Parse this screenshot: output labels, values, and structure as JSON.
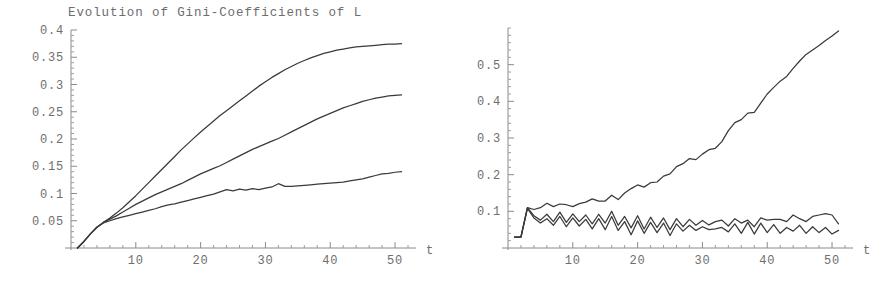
{
  "page": {
    "background_color": "#ffffff",
    "line_color": "#3a3a3a",
    "axis_color": "#8a8a8a",
    "text_color": "#6e6e6e"
  },
  "panels": [
    {
      "id": "left",
      "title": "Evolution of Gini-Coefficients of L",
      "xlabel": "t",
      "ylabel": "",
      "ytick_labels": [
        "0.05",
        "0.1",
        "0.15",
        "0.2",
        "0.25",
        "0.3",
        "0.35",
        "0.4"
      ],
      "xtick_labels": [
        "10",
        "20",
        "30",
        "40",
        "50"
      ]
    },
    {
      "id": "right",
      "title": "Evolution of Gini-Coefficients of Y / L",
      "xlabel": "t",
      "ylabel": "",
      "ytick_labels": [
        "0.1",
        "0.2",
        "0.3",
        "0.4",
        "0.5"
      ],
      "xtick_labels": [
        "10",
        "20",
        "30",
        "40",
        "50"
      ]
    }
  ],
  "chart_data": [
    {
      "type": "line",
      "title": "Evolution of Gini-Coefficients of L",
      "xlabel": "t",
      "ylabel": "",
      "xlim": [
        0,
        52
      ],
      "ylim": [
        0,
        0.4
      ],
      "xticks": [
        10,
        20,
        30,
        40,
        50
      ],
      "yticks": [
        0.05,
        0.1,
        0.15,
        0.2,
        0.25,
        0.3,
        0.35,
        0.4
      ],
      "grid": false,
      "legend": "none",
      "x": [
        1,
        2,
        3,
        4,
        5,
        6,
        7,
        8,
        9,
        10,
        11,
        12,
        13,
        14,
        15,
        16,
        17,
        18,
        19,
        20,
        21,
        22,
        23,
        24,
        25,
        26,
        27,
        28,
        29,
        30,
        31,
        32,
        33,
        34,
        35,
        36,
        37,
        38,
        39,
        40,
        41,
        42,
        43,
        44,
        45,
        46,
        47,
        48,
        49,
        50,
        51
      ],
      "series": [
        {
          "name": "upper",
          "values": [
            0.0,
            0.012,
            0.026,
            0.038,
            0.047,
            0.055,
            0.064,
            0.074,
            0.085,
            0.096,
            0.108,
            0.12,
            0.132,
            0.144,
            0.156,
            0.168,
            0.18,
            0.191,
            0.202,
            0.213,
            0.223,
            0.233,
            0.243,
            0.252,
            0.261,
            0.27,
            0.279,
            0.288,
            0.297,
            0.305,
            0.313,
            0.32,
            0.327,
            0.333,
            0.339,
            0.344,
            0.349,
            0.353,
            0.357,
            0.36,
            0.363,
            0.365,
            0.367,
            0.369,
            0.37,
            0.371,
            0.372,
            0.373,
            0.374,
            0.374,
            0.375
          ]
        },
        {
          "name": "middle",
          "values": [
            0.0,
            0.012,
            0.026,
            0.038,
            0.047,
            0.053,
            0.059,
            0.066,
            0.073,
            0.08,
            0.086,
            0.092,
            0.098,
            0.103,
            0.108,
            0.113,
            0.118,
            0.124,
            0.13,
            0.136,
            0.141,
            0.146,
            0.151,
            0.157,
            0.163,
            0.169,
            0.175,
            0.181,
            0.186,
            0.191,
            0.196,
            0.201,
            0.207,
            0.213,
            0.219,
            0.225,
            0.231,
            0.237,
            0.242,
            0.247,
            0.252,
            0.257,
            0.261,
            0.265,
            0.269,
            0.272,
            0.275,
            0.277,
            0.279,
            0.28,
            0.281
          ]
        },
        {
          "name": "lower",
          "values": [
            0.0,
            0.012,
            0.026,
            0.038,
            0.046,
            0.05,
            0.054,
            0.057,
            0.06,
            0.063,
            0.066,
            0.069,
            0.072,
            0.076,
            0.079,
            0.081,
            0.084,
            0.087,
            0.09,
            0.093,
            0.096,
            0.099,
            0.103,
            0.107,
            0.105,
            0.108,
            0.106,
            0.109,
            0.107,
            0.11,
            0.112,
            0.118,
            0.113,
            0.113,
            0.114,
            0.115,
            0.116,
            0.117,
            0.118,
            0.119,
            0.12,
            0.121,
            0.123,
            0.125,
            0.127,
            0.13,
            0.133,
            0.136,
            0.137,
            0.139,
            0.14
          ]
        }
      ]
    },
    {
      "type": "line",
      "title": "Evolution of Gini-Coefficients of Y / L",
      "xlabel": "t",
      "ylabel": "",
      "xlim": [
        0,
        52
      ],
      "ylim": [
        0,
        0.6
      ],
      "xticks": [
        10,
        20,
        30,
        40,
        50
      ],
      "yticks": [
        0.1,
        0.2,
        0.3,
        0.4,
        0.5
      ],
      "grid": false,
      "legend": "none",
      "x": [
        1,
        2,
        3,
        4,
        5,
        6,
        7,
        8,
        9,
        10,
        11,
        12,
        13,
        14,
        15,
        16,
        17,
        18,
        19,
        20,
        21,
        22,
        23,
        24,
        25,
        26,
        27,
        28,
        29,
        30,
        31,
        32,
        33,
        34,
        35,
        36,
        37,
        38,
        39,
        40,
        41,
        42,
        43,
        44,
        45,
        46,
        47,
        48,
        49,
        50,
        51
      ],
      "series": [
        {
          "name": "rising",
          "values": [
            0.03,
            0.03,
            0.11,
            0.105,
            0.11,
            0.122,
            0.113,
            0.12,
            0.118,
            0.113,
            0.121,
            0.125,
            0.134,
            0.128,
            0.128,
            0.144,
            0.132,
            0.15,
            0.162,
            0.172,
            0.166,
            0.178,
            0.18,
            0.196,
            0.202,
            0.222,
            0.23,
            0.244,
            0.241,
            0.256,
            0.268,
            0.272,
            0.29,
            0.32,
            0.342,
            0.35,
            0.368,
            0.37,
            0.395,
            0.42,
            0.438,
            0.455,
            0.468,
            0.49,
            0.51,
            0.528,
            0.54,
            0.552,
            0.566,
            0.578,
            0.592
          ]
        },
        {
          "name": "oscillating-a",
          "values": [
            0.03,
            0.03,
            0.11,
            0.088,
            0.076,
            0.092,
            0.072,
            0.098,
            0.07,
            0.093,
            0.072,
            0.09,
            0.066,
            0.092,
            0.068,
            0.1,
            0.062,
            0.086,
            0.055,
            0.088,
            0.052,
            0.084,
            0.056,
            0.082,
            0.05,
            0.08,
            0.058,
            0.078,
            0.062,
            0.075,
            0.063,
            0.072,
            0.076,
            0.06,
            0.08,
            0.068,
            0.076,
            0.058,
            0.082,
            0.076,
            0.078,
            0.078,
            0.072,
            0.09,
            0.08,
            0.072,
            0.086,
            0.09,
            0.094,
            0.09,
            0.066
          ]
        },
        {
          "name": "oscillating-b",
          "values": [
            0.03,
            0.03,
            0.108,
            0.082,
            0.068,
            0.08,
            0.062,
            0.086,
            0.058,
            0.082,
            0.06,
            0.078,
            0.052,
            0.08,
            0.05,
            0.086,
            0.048,
            0.072,
            0.036,
            0.074,
            0.04,
            0.07,
            0.042,
            0.068,
            0.034,
            0.066,
            0.046,
            0.062,
            0.048,
            0.058,
            0.05,
            0.052,
            0.056,
            0.044,
            0.066,
            0.04,
            0.07,
            0.038,
            0.068,
            0.042,
            0.064,
            0.04,
            0.056,
            0.046,
            0.062,
            0.04,
            0.058,
            0.042,
            0.056,
            0.038,
            0.048
          ]
        }
      ]
    }
  ]
}
